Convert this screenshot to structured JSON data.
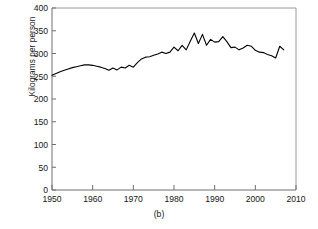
{
  "figure": {
    "caption": "(b)"
  },
  "chart_data": {
    "type": "line",
    "title": "",
    "subtitle": "",
    "xlabel": "",
    "ylabel": "Kilograms per person",
    "xlim": [
      1950,
      2010
    ],
    "ylim": [
      0,
      400
    ],
    "xticks": [
      1950,
      1960,
      1970,
      1980,
      1990,
      2000,
      2010
    ],
    "xtick_labels": [
      "1950",
      "1960",
      "1970",
      "1980",
      "1990",
      "2000",
      "2010"
    ],
    "yticks": [
      0,
      50,
      100,
      150,
      200,
      250,
      300,
      350,
      400
    ],
    "ytick_labels": [
      "0",
      "50",
      "100",
      "150",
      "200",
      "250",
      "300",
      "350",
      "400"
    ],
    "grid": false,
    "legend": false,
    "legend_position": "none",
    "line_color": "#000000",
    "line_width": 1.1,
    "series": [
      {
        "name": "Consumption per person",
        "x": [
          1950,
          1951,
          1952,
          1953,
          1954,
          1955,
          1956,
          1957,
          1958,
          1959,
          1960,
          1961,
          1962,
          1963,
          1964,
          1965,
          1966,
          1967,
          1968,
          1969,
          1970,
          1971,
          1972,
          1973,
          1974,
          1975,
          1976,
          1977,
          1978,
          1979,
          1980,
          1981,
          1982,
          1983,
          1984,
          1985,
          1986,
          1987,
          1988,
          1989,
          1990,
          1991,
          1992,
          1993,
          1994,
          1995,
          1996,
          1997,
          1998,
          1999,
          2000,
          2001,
          2002,
          2003,
          2004,
          2005,
          2006,
          2007
        ],
        "values": [
          252,
          256,
          260,
          263,
          266,
          269,
          271,
          273,
          275,
          275,
          274,
          272,
          270,
          267,
          263,
          268,
          264,
          270,
          268,
          274,
          270,
          280,
          288,
          292,
          293,
          296,
          299,
          303,
          300,
          303,
          314,
          306,
          318,
          308,
          327,
          345,
          322,
          342,
          318,
          331,
          325,
          326,
          337,
          326,
          313,
          314,
          308,
          312,
          318,
          316,
          307,
          303,
          302,
          298,
          295,
          290,
          316,
          308
        ]
      }
    ]
  }
}
